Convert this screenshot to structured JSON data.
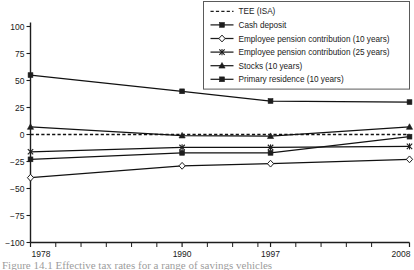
{
  "chart_data": {
    "type": "line",
    "title": "",
    "xlabel": "",
    "ylabel": "",
    "x": [
      1978,
      1990,
      1997,
      2008
    ],
    "xtick_labels": [
      "1978",
      "1990",
      "1997",
      "2008"
    ],
    "ytick_labels": [
      "100",
      "75",
      "50",
      "25",
      "0",
      "-25",
      "-50",
      "-75",
      "-100"
    ],
    "ytick_values": [
      100,
      75,
      50,
      25,
      0,
      -25,
      -50,
      -75,
      -100
    ],
    "xlim": [
      1978,
      2008
    ],
    "ylim": [
      -100,
      100
    ],
    "grid": false,
    "legend_position": "top-right",
    "minor_xticks": [
      1980,
      1982,
      1984,
      1986,
      1988,
      1992,
      1994,
      1996,
      1999,
      2001,
      2003,
      2005
    ],
    "series": [
      {
        "name": "TEE (ISA)",
        "values": [
          0,
          0,
          0,
          0
        ],
        "marker": "none",
        "line": "dashed",
        "color": "#111111"
      },
      {
        "name": "Cash deposit",
        "values": [
          55,
          40,
          31,
          30
        ],
        "marker": "filled-square",
        "line": "solid",
        "color": "#111111"
      },
      {
        "name": "Employee pension contribution (10 years)",
        "values": [
          -40,
          -29,
          -27,
          -23
        ],
        "marker": "open-diamond",
        "line": "solid",
        "color": "#111111"
      },
      {
        "name": "Employee pension contribution (25 years)",
        "values": [
          -16,
          -12,
          -12,
          -11
        ],
        "marker": "x-cross",
        "line": "solid",
        "color": "#111111"
      },
      {
        "name": "Stocks (10 years)",
        "values": [
          7,
          -1,
          -1.5,
          7
        ],
        "marker": "filled-triangle",
        "line": "solid",
        "color": "#111111"
      },
      {
        "name": "Primary residence (10 years)",
        "values": [
          -23,
          -17,
          -17,
          -2
        ],
        "marker": "filled-square",
        "line": "solid",
        "color": "#111111"
      }
    ]
  },
  "legend": {
    "entries": [
      {
        "label": "TEE (ISA)"
      },
      {
        "label": "Cash deposit"
      },
      {
        "label": "Employee pension contribution (10 years)"
      },
      {
        "label": "Employee pension contribution (25 years)"
      },
      {
        "label": "Stocks (10 years)"
      },
      {
        "label": "Primary residence (10 years)"
      }
    ]
  },
  "caption": {
    "text": "Figure 14.1  Effective tax rates for a range of savings vehicles"
  }
}
